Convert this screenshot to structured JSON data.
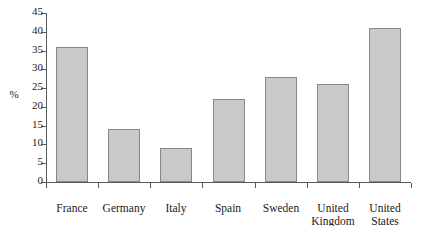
{
  "chart_data": {
    "type": "bar",
    "title": "",
    "xlabel": "",
    "ylabel": "%",
    "categories": [
      "France",
      "Germany",
      "Italy",
      "Spain",
      "Sweden",
      "United Kingdom",
      "United States"
    ],
    "values": [
      36,
      14,
      9,
      22,
      28,
      26,
      41
    ],
    "ylim": [
      0,
      45
    ],
    "ytick_labels": [
      "0",
      "5",
      "10",
      "15",
      "20",
      "25",
      "30",
      "35",
      "40",
      "45"
    ],
    "ytick_values": [
      0,
      5,
      10,
      15,
      20,
      25,
      30,
      35,
      40,
      45
    ],
    "grid": false,
    "legend": false,
    "bar_color": "#c9c9c9",
    "bar_edge_color": "#888888",
    "axis_color": "#5a5a5a",
    "background": "#ffffff"
  }
}
